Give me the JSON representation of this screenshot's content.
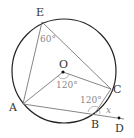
{
  "diagram": {
    "type": "circle-geometry",
    "colors": {
      "circle": "#222222",
      "lines": "#777777",
      "labels": "#333333",
      "angle_labels": "#888888"
    },
    "points": {
      "E": "E",
      "O": "O",
      "A": "A",
      "B": "B",
      "C": "C",
      "D": "D"
    },
    "angles": {
      "at_E": "60°",
      "at_O": "120°",
      "at_B": "120°",
      "unknown": "x"
    }
  }
}
